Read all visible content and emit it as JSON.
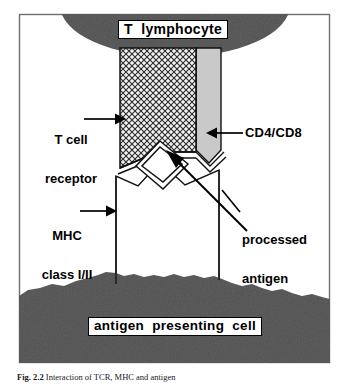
{
  "figure": {
    "frame_color": "#6b6b6b",
    "background_color": "#ffffff"
  },
  "labels": {
    "t_lymphocyte": "T  lymphocyte",
    "t_cell_receptor_line1": "T cell",
    "t_cell_receptor_line2": "receptor",
    "cd4_cd8": "CD4/CD8",
    "mhc_line1": "MHC",
    "mhc_line2": "class I/II",
    "processed_antigen_line1": "processed",
    "processed_antigen_line2": "antigen",
    "antigen_presenting_cell": "antigen  presenting  cell"
  },
  "caption": {
    "figure_number": "Fig. 2.2",
    "text": "Interaction of TCR, MHC and antigen"
  },
  "colors": {
    "cell_dark": "#1c1c1c",
    "tcr_hatch_fill": "#f0f0f0",
    "cd_column_fill": "#c9c9c9",
    "outline": "#000000",
    "frame": "#6f6f6f"
  },
  "icons": {
    "arrow_right": "arrow-right-icon",
    "arrow_left": "arrow-left-icon",
    "arrow_diagonal": "arrow-diagonal-icon",
    "leader_line": "leader-line-icon"
  },
  "structures": {
    "t_lymphocyte_shape": "ellipse",
    "t_cell_receptor_shape": "hatched-column",
    "cd4_cd8_shape": "gray-column",
    "mhc_shape": "open-column",
    "processed_antigen_shape": "diamond",
    "apc_shape": "irregular-dark-mass"
  }
}
